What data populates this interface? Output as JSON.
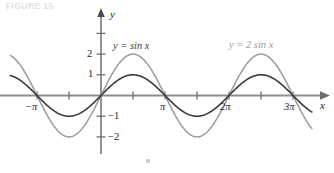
{
  "figure": {
    "caption": "FIGURE 15",
    "width": 334,
    "height": 173
  },
  "axes": {
    "x_axis_label": "x",
    "y_axis_label": "y",
    "origin_px": {
      "x": 101,
      "y": 95.5
    },
    "pi_px": 64,
    "unit_px": 20.7,
    "x_ticks": [
      {
        "label": "−π",
        "value": -3.14159,
        "labeled": true
      },
      {
        "label": "",
        "value": -1.5708,
        "labeled": false
      },
      {
        "label": "",
        "value": 1.5708,
        "labeled": false
      },
      {
        "label": "π",
        "value": 3.14159,
        "labeled": true
      },
      {
        "label": "",
        "value": 4.71239,
        "labeled": false
      },
      {
        "label": "2π",
        "value": 6.28319,
        "labeled": true
      },
      {
        "label": "",
        "value": 7.85398,
        "labeled": false
      },
      {
        "label": "3π",
        "value": 9.42478,
        "labeled": true
      }
    ],
    "y_ticks": [
      {
        "label": "",
        "value": 3,
        "labeled": false
      },
      {
        "label": "2",
        "value": 2,
        "labeled": true
      },
      {
        "label": "1",
        "value": 1,
        "labeled": true
      },
      {
        "label": "−1",
        "value": -1,
        "labeled": true
      },
      {
        "label": "−2",
        "value": -2,
        "labeled": true
      }
    ],
    "x_range": [
      -4.45,
      11.5
    ],
    "y_range": [
      -2.7,
      3.6
    ]
  },
  "colors": {
    "axis": "#8d8d8d",
    "curve_sin": "#3a3a3a",
    "curve_2sin": "#9b9b9b",
    "text": "#262626",
    "caption": "#c9c9c9"
  },
  "chart_data": {
    "type": "line",
    "title": "",
    "xlabel": "x",
    "ylabel": "y",
    "xlim": [
      -4.45,
      11.5
    ],
    "ylim": [
      -2.7,
      3.6
    ],
    "grid": false,
    "legend": "inline-annotations",
    "xtick_labels": [
      "−π",
      "π",
      "2π",
      "3π"
    ],
    "xtick_values": [
      -3.14159,
      3.14159,
      6.28319,
      9.42478
    ],
    "ytick_labels": [
      "2",
      "1",
      "−1",
      "−2"
    ],
    "ytick_values": [
      2,
      1,
      -1,
      -2
    ],
    "series": [
      {
        "name": "y = sin x",
        "formula": "sin(x)",
        "amplitude": 1,
        "period": 6.28319,
        "color": "#3a3a3a",
        "domain": [
          -4.45,
          10.35
        ],
        "key_points": [
          {
            "x": -3.14159,
            "y": 0
          },
          {
            "x": -1.5708,
            "y": -1
          },
          {
            "x": 0,
            "y": 0
          },
          {
            "x": 1.5708,
            "y": 1
          },
          {
            "x": 3.14159,
            "y": 0
          },
          {
            "x": 4.71239,
            "y": -1
          },
          {
            "x": 6.28319,
            "y": 0
          },
          {
            "x": 7.85398,
            "y": 1
          },
          {
            "x": 9.42478,
            "y": 0
          }
        ]
      },
      {
        "name": "y = 2 sin x",
        "formula": "2*sin(x)",
        "amplitude": 2,
        "period": 6.28319,
        "color": "#9b9b9b",
        "domain": [
          -4.45,
          10.35
        ],
        "key_points": [
          {
            "x": -3.14159,
            "y": 0
          },
          {
            "x": -1.5708,
            "y": -2
          },
          {
            "x": 0,
            "y": 0
          },
          {
            "x": 1.5708,
            "y": 2
          },
          {
            "x": 3.14159,
            "y": 0
          },
          {
            "x": 4.71239,
            "y": -2
          },
          {
            "x": 6.28319,
            "y": 0
          },
          {
            "x": 7.85398,
            "y": 2
          },
          {
            "x": 9.42478,
            "y": 0
          }
        ]
      }
    ],
    "annotations": [
      {
        "text": "y = sin x",
        "x_px": 113,
        "y_px": 47,
        "color": "#3f3f3f"
      },
      {
        "text": "y = 2 sin x",
        "x_px": 231,
        "y_px": 46,
        "color": "#9a9a9a"
      }
    ]
  },
  "labels": {
    "sin_label": "y = sin x",
    "two_sin_label": "y = 2 sin x"
  }
}
